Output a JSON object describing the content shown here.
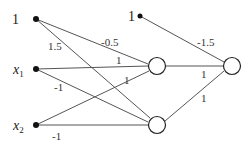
{
  "diagram": {
    "type": "neural-network",
    "inputs": [
      {
        "id": "bias1",
        "label": "1",
        "x": 36,
        "y": 19
      },
      {
        "id": "x1",
        "label": "x",
        "sub": "1",
        "x": 36,
        "y": 69
      },
      {
        "id": "x2",
        "label": "x",
        "sub": "2",
        "x": 36,
        "y": 125
      }
    ],
    "bias_output": {
      "id": "bias2",
      "label": "1",
      "x": 140,
      "y": 16
    },
    "hidden": [
      {
        "id": "h1",
        "x": 157,
        "y": 66
      },
      {
        "id": "h2",
        "x": 157,
        "y": 125
      }
    ],
    "output": {
      "id": "out",
      "x": 232,
      "y": 66
    },
    "weights": {
      "bias1_h1": "-0.5",
      "bias1_h2": "1.5",
      "x1_h1": "1",
      "x1_h2": "-1",
      "x2_h1": "1",
      "x2_h2": "-1",
      "bias2_out": "-1.5",
      "h1_out": "1",
      "h2_out": "1"
    }
  }
}
